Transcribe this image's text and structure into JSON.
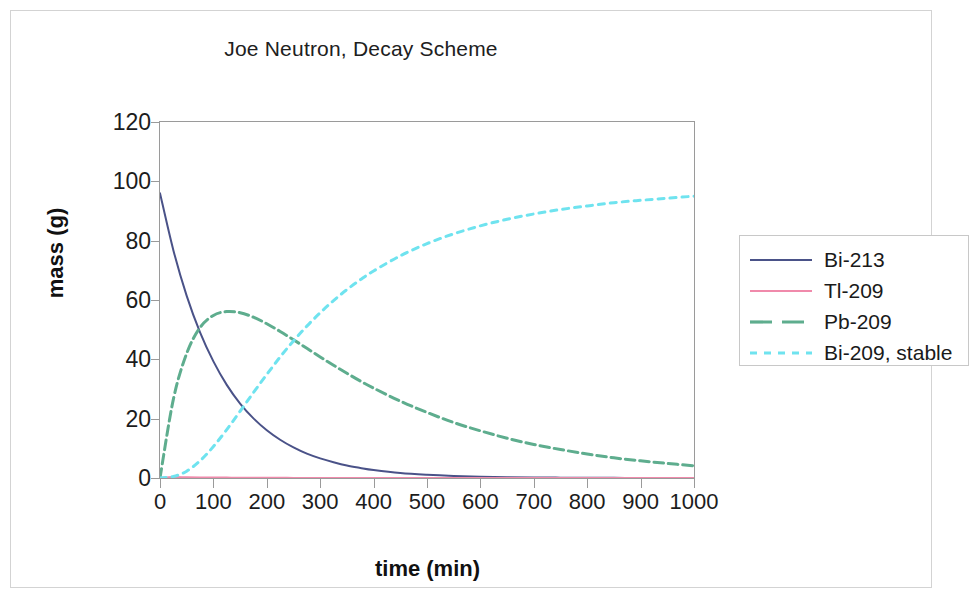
{
  "chart": {
    "title": "Joe Neutron, Decay Scheme",
    "xlabel": "time (min)",
    "ylabel": "mass (g)"
  },
  "legend": {
    "items": [
      {
        "label": "Bi-213",
        "color": "#4a5288",
        "style": "solid"
      },
      {
        "label": "Tl-209",
        "color": "#f08aab",
        "style": "solid"
      },
      {
        "label": "Pb-209",
        "color": "#5ead8e",
        "style": "dashed"
      },
      {
        "label": "Bi-209, stable",
        "color": "#6fe3ef",
        "style": "dotted"
      }
    ]
  },
  "chart_data": {
    "type": "line",
    "title": "Joe Neutron, Decay Scheme",
    "xlabel": "time (min)",
    "ylabel": "mass (g)",
    "xlim": [
      0,
      1000
    ],
    "ylim": [
      0,
      120
    ],
    "xticks": [
      0,
      100,
      200,
      300,
      400,
      500,
      600,
      700,
      800,
      900,
      1000
    ],
    "yticks": [
      0,
      20,
      40,
      60,
      80,
      100,
      120
    ],
    "grid": false,
    "legend_position": "right",
    "x": [
      0,
      25,
      50,
      75,
      100,
      125,
      150,
      175,
      200,
      225,
      250,
      275,
      300,
      325,
      350,
      375,
      400,
      450,
      500,
      550,
      600,
      650,
      700,
      750,
      800,
      850,
      900,
      950,
      1000
    ],
    "series": [
      {
        "name": "Bi-213",
        "color": "#4a5288",
        "style": "solid",
        "values": [
          96.0,
          76.8,
          61.4,
          49.1,
          39.3,
          31.4,
          25.1,
          20.1,
          16.1,
          12.9,
          10.3,
          8.2,
          6.6,
          5.3,
          4.2,
          3.4,
          2.7,
          1.7,
          1.1,
          0.7,
          0.45,
          0.29,
          0.18,
          0.12,
          0.07,
          0.05,
          0.03,
          0.02,
          0.01
        ]
      },
      {
        "name": "Tl-209",
        "color": "#f08aab",
        "style": "solid",
        "values": [
          0.0,
          0.3,
          0.25,
          0.2,
          0.16,
          0.13,
          0.1,
          0.08,
          0.06,
          0.05,
          0.04,
          0.03,
          0.03,
          0.02,
          0.02,
          0.01,
          0.01,
          0.01,
          0.0,
          0.0,
          0.0,
          0.0,
          0.0,
          0.0,
          0.0,
          0.0,
          0.0,
          0.0,
          0.0
        ]
      },
      {
        "name": "Pb-209",
        "color": "#5ead8e",
        "style": "dashed",
        "values": [
          0.0,
          26.5,
          42.0,
          50.7,
          54.8,
          56.1,
          55.7,
          54.2,
          52.0,
          49.4,
          46.6,
          43.7,
          40.8,
          38.0,
          35.3,
          32.7,
          30.3,
          25.9,
          22.1,
          18.7,
          15.9,
          13.4,
          11.3,
          9.6,
          8.1,
          6.8,
          5.8,
          4.9,
          4.1
        ]
      },
      {
        "name": "Bi-209, stable",
        "color": "#6fe3ef",
        "style": "dotted",
        "values": [
          0.0,
          0.5,
          2.3,
          5.8,
          10.6,
          16.3,
          22.5,
          28.8,
          34.9,
          40.8,
          46.2,
          51.2,
          55.7,
          59.8,
          63.5,
          66.8,
          69.8,
          74.9,
          79.0,
          82.3,
          85.0,
          87.2,
          89.0,
          90.5,
          91.7,
          92.8,
          93.6,
          94.3,
          95.0
        ]
      }
    ]
  }
}
